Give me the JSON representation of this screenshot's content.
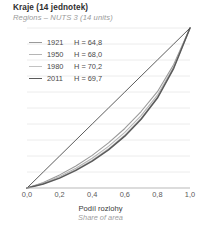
{
  "header": {
    "title": "Kraje (14 jednotek)",
    "subtitle": "Regions – NUTS 3 (14 units)"
  },
  "legend": {
    "items": [
      {
        "year": "1921",
        "value": "H = 64,8",
        "color": "#9a9a9a",
        "width": 1.0
      },
      {
        "year": "1950",
        "value": "H = 68,0",
        "color": "#b5b5b5",
        "width": 1.0
      },
      {
        "year": "1980",
        "value": "H = 70,2",
        "color": "#c2c2c2",
        "width": 1.0
      },
      {
        "year": "2011",
        "value": "H = 69,7",
        "color": "#5a5a5a",
        "width": 1.6
      }
    ]
  },
  "axis": {
    "x_label": "Podíl rozlohy",
    "x_label_sub": "Share of area",
    "x_ticks": [
      "0,0",
      "0,2",
      "0,4",
      "0,6",
      "0,8",
      "1,0"
    ]
  },
  "chart_data": {
    "type": "line",
    "title": "Kraje (14 jednotek)",
    "subtitle": "Regions – NUTS 3 (14 units)",
    "xlabel": "Podíl rozlohy / Share of area",
    "ylabel": "",
    "xlim": [
      0,
      1
    ],
    "ylim": [
      0,
      1
    ],
    "grid": "horizontal",
    "gridlines_y": [
      0.1,
      0.2,
      0.3,
      0.4,
      0.5,
      0.6,
      0.7,
      0.8,
      0.9,
      1.0
    ],
    "legend_position": "upper-left",
    "x": [
      0,
      0.1,
      0.2,
      0.3,
      0.4,
      0.5,
      0.6,
      0.7,
      0.8,
      0.9,
      1.0
    ],
    "series": [
      {
        "name": "1921",
        "label": "1921  H = 64,8",
        "index_H": 64.8,
        "color": "#9a9a9a",
        "values": [
          0,
          0.035,
          0.082,
          0.138,
          0.204,
          0.282,
          0.372,
          0.478,
          0.602,
          0.772,
          1.0
        ]
      },
      {
        "name": "1950",
        "label": "1950  H = 68,0",
        "index_H": 68.0,
        "color": "#b5b5b5",
        "values": [
          0,
          0.03,
          0.072,
          0.124,
          0.186,
          0.26,
          0.348,
          0.452,
          0.58,
          0.758,
          1.0
        ]
      },
      {
        "name": "1980",
        "label": "1980  H = 70,2",
        "index_H": 70.2,
        "color": "#c2c2c2",
        "values": [
          0,
          0.027,
          0.066,
          0.115,
          0.174,
          0.245,
          0.331,
          0.436,
          0.566,
          0.75,
          1.0
        ]
      },
      {
        "name": "2011",
        "label": "2011  H = 69,7",
        "index_H": 69.7,
        "color": "#5a5a5a",
        "values": [
          0,
          0.025,
          0.062,
          0.11,
          0.168,
          0.238,
          0.324,
          0.43,
          0.562,
          0.748,
          1.0
        ]
      },
      {
        "name": "equality",
        "label": "line of equality",
        "color": "#4a4a4a",
        "values": [
          0,
          0.1,
          0.2,
          0.3,
          0.4,
          0.5,
          0.6,
          0.7,
          0.8,
          0.9,
          1.0
        ]
      }
    ]
  }
}
